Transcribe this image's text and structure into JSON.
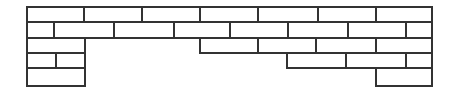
{
  "figure": {
    "name": "brick-wall-diagram",
    "canvas": {
      "width": 456,
      "height": 93
    },
    "background_color": "#ffffff",
    "stroke_color": "#333333",
    "brick_fill_color": "#ffffff",
    "stroke_width": 1.4
  },
  "chart_data": {
    "type": "diagram",
    "xlabel": "",
    "ylabel": "",
    "xlim": [
      27,
      432
    ],
    "ylim": [
      7,
      86
    ],
    "grid": false,
    "legend": "none",
    "row_count": 5,
    "brick_count": 31,
    "rows": [
      {
        "index": 0,
        "name": "course-1",
        "y": 7,
        "height": 15,
        "bricks": [
          {
            "x": 27,
            "width": 57
          },
          {
            "x": 84,
            "width": 58
          },
          {
            "x": 142,
            "width": 58
          },
          {
            "x": 200,
            "width": 58
          },
          {
            "x": 258,
            "width": 60
          },
          {
            "x": 318,
            "width": 58
          },
          {
            "x": 376,
            "width": 56
          }
        ]
      },
      {
        "index": 1,
        "name": "course-2",
        "y": 22,
        "height": 16,
        "bricks": [
          {
            "x": 27,
            "width": 27
          },
          {
            "x": 54,
            "width": 60
          },
          {
            "x": 114,
            "width": 60
          },
          {
            "x": 174,
            "width": 56
          },
          {
            "x": 230,
            "width": 58
          },
          {
            "x": 288,
            "width": 60
          },
          {
            "x": 348,
            "width": 58
          },
          {
            "x": 406,
            "width": 26
          }
        ]
      },
      {
        "index": 2,
        "name": "course-3",
        "y": 38,
        "height": 15,
        "bricks": [
          {
            "x": 27,
            "width": 58
          },
          {
            "x": 200,
            "width": 58
          },
          {
            "x": 258,
            "width": 58
          },
          {
            "x": 316,
            "width": 60
          },
          {
            "x": 376,
            "width": 56
          }
        ]
      },
      {
        "index": 3,
        "name": "course-4",
        "y": 53,
        "height": 15,
        "bricks": [
          {
            "x": 27,
            "width": 29
          },
          {
            "x": 56,
            "width": 29
          },
          {
            "x": 287,
            "width": 59
          },
          {
            "x": 346,
            "width": 60
          },
          {
            "x": 406,
            "width": 26
          }
        ]
      },
      {
        "index": 4,
        "name": "course-5",
        "y": 68,
        "height": 18,
        "bricks": [
          {
            "x": 27,
            "width": 58
          },
          {
            "x": 376,
            "width": 56
          }
        ]
      }
    ]
  }
}
